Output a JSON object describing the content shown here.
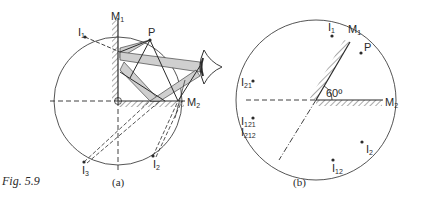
{
  "caption": "Fig. 5.9",
  "panel_a": {
    "label": "(a)",
    "mirror_1": "M",
    "mirror_1_sub": "1",
    "mirror_2": "M",
    "mirror_2_sub": "2",
    "object": "P",
    "images": [
      {
        "main": "I",
        "sub": "1"
      },
      {
        "main": "I",
        "sub": "2"
      },
      {
        "main": "I",
        "sub": "3"
      }
    ]
  },
  "panel_b": {
    "label": "(b)",
    "mirror_1": "M",
    "mirror_1_sub": "1",
    "mirror_2": "M",
    "mirror_2_sub": "2",
    "object": "P",
    "angle": "60º",
    "images": [
      {
        "main": "I",
        "sub": "1"
      },
      {
        "main": "I",
        "sub": "21"
      },
      {
        "main": "I",
        "sub": "121"
      },
      {
        "main": "I",
        "sub": "212"
      },
      {
        "main": "I",
        "sub": "2"
      },
      {
        "main": "I",
        "sub": "12"
      }
    ]
  },
  "colors": {
    "ink": "#2a2a2a",
    "beam": "#cfcfcf"
  }
}
